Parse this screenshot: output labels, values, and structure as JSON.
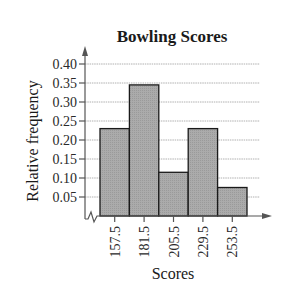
{
  "chart_data": {
    "type": "bar",
    "subtype": "histogram",
    "title": "Bowling Scores",
    "xlabel": "Scores",
    "ylabel": "Relative frequency",
    "categories": [
      "157.5",
      "181.5",
      "205.5",
      "229.5",
      "253.5"
    ],
    "values": [
      0.23,
      0.345,
      0.115,
      0.23,
      0.075
    ],
    "yticks": [
      "0.05",
      "0.10",
      "0.15",
      "0.20",
      "0.25",
      "0.30",
      "0.35",
      "0.40"
    ],
    "ytick_values": [
      0.05,
      0.1,
      0.15,
      0.2,
      0.25,
      0.3,
      0.35,
      0.4
    ],
    "ylim": [
      0,
      0.42
    ],
    "grid": true,
    "axis_break": true,
    "legend": null,
    "colors": {
      "bar_fill": "#a8a8a8",
      "bar_stroke": "#1a1a1a",
      "grid": "#b0b0b0",
      "axis": "#555555",
      "text": "#1a1a1a"
    }
  }
}
